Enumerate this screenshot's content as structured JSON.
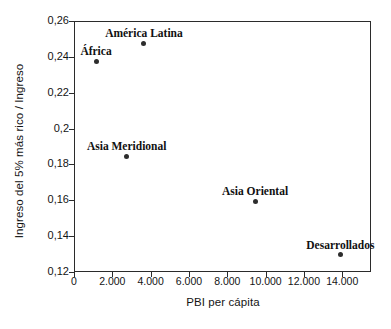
{
  "chart_data": {
    "type": "scatter",
    "title": "",
    "xlabel": "PBI per cápita",
    "ylabel": "Ingreso del 5% más rico / Ingreso",
    "xlim": [
      0,
      15500
    ],
    "ylim": [
      0.12,
      0.26
    ],
    "grid": false,
    "legend": "none",
    "x_tick_labels": [
      "0",
      "2.000",
      "4.000",
      "6.000",
      "8.000",
      "10.000",
      "12.000",
      "14.000"
    ],
    "x_tick_values": [
      0,
      2000,
      4000,
      6000,
      8000,
      10000,
      12000,
      14000
    ],
    "y_tick_labels": [
      "0,26",
      "0,24",
      "0,22",
      "0,2",
      "0,18",
      "0,16",
      "0,14",
      "0,12"
    ],
    "y_tick_values": [
      0.26,
      0.24,
      0.22,
      0.2,
      0.18,
      0.16,
      0.14,
      0.12
    ],
    "points": [
      {
        "label": "África",
        "x": 1150,
        "y": 0.2375
      },
      {
        "label": "América Latina",
        "x": 3650,
        "y": 0.2475
      },
      {
        "label": "Asia Meridional",
        "x": 2750,
        "y": 0.1845
      },
      {
        "label": "Asia Oriental",
        "x": 9450,
        "y": 0.1595
      },
      {
        "label": "Desarrollados",
        "x": 13900,
        "y": 0.1295
      }
    ],
    "marker_color": "#2d2d2d",
    "axis_color": "#2b2b2b",
    "background_color": "#ffffff"
  }
}
